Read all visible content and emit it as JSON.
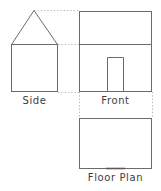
{
  "diagram": {
    "stroke_color": "#6b6b6b",
    "guide_color": "#b9b9b9",
    "door_mark_color": "#5a5a5a",
    "background_color": "#ffffff",
    "views": [
      {
        "id": "side",
        "label": "Side",
        "shape": "square-with-triangular-roof",
        "body": {
          "x": 11,
          "y": 44,
          "width": 47,
          "height": 48
        },
        "roof": {
          "apex_x": 34,
          "apex_y": 10,
          "left_x": 11,
          "right_x": 58,
          "base_y": 44
        }
      },
      {
        "id": "front",
        "label": "Front",
        "shape": "rectangle-with-roof-line-and-door",
        "body": {
          "x": 79,
          "y": 11,
          "width": 73,
          "height": 81
        },
        "roof_line_y": 44,
        "door": {
          "x": 107,
          "y": 57,
          "width": 17,
          "height": 35
        }
      },
      {
        "id": "floor-plan",
        "label": "Floor Plan",
        "shape": "rectangle-with-door-opening",
        "body": {
          "x": 79,
          "y": 118,
          "width": 73,
          "height": 51
        },
        "door_mark": {
          "x1": 106,
          "x2": 125,
          "y": 169
        }
      }
    ],
    "guides": [
      {
        "id": "apex-to-front-top",
        "orientation": "horizontal",
        "x1": 34,
        "x2": 79,
        "y": 10
      },
      {
        "id": "eave-to-front-divide",
        "orientation": "horizontal",
        "x1": 58,
        "x2": 79,
        "y": 44
      },
      {
        "id": "base-to-front-base",
        "orientation": "horizontal",
        "x1": 58,
        "x2": 79,
        "y": 92
      },
      {
        "id": "front-left-to-plan",
        "orientation": "vertical",
        "x": 79,
        "y1": 92,
        "y2": 118
      },
      {
        "id": "front-right-to-plan",
        "orientation": "vertical",
        "x": 152,
        "y1": 92,
        "y2": 118
      }
    ]
  }
}
